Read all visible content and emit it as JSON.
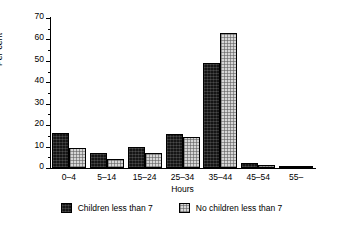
{
  "chart_data": {
    "type": "bar",
    "title": "",
    "xlabel": "Hours",
    "ylabel": "Per cent",
    "categories": [
      "0–4",
      "5–14",
      "15–24",
      "25–34",
      "35–44",
      "45–54",
      "55–"
    ],
    "series": [
      {
        "name": "Children less than 7",
        "color": "#151515",
        "values": [
          16.5,
          7,
          10,
          16,
          49,
          2.2,
          0.8
        ]
      },
      {
        "name": "No children less than 7",
        "color": "#d6d6d6",
        "values": [
          9.5,
          4,
          7,
          14.5,
          63,
          1.4,
          0.8
        ]
      }
    ],
    "ylim": [
      0,
      70
    ],
    "ytick_labels": [
      "0",
      "10",
      "20",
      "30",
      "40",
      "50",
      "60",
      "70"
    ],
    "ytick_values": [
      0,
      10,
      20,
      30,
      40,
      50,
      60,
      70
    ],
    "yminor_values": [
      5,
      15,
      25,
      35,
      45,
      55,
      65
    ],
    "grid": false,
    "legend_position": "bottom"
  },
  "legend": {
    "items": [
      {
        "label": "Children less than 7"
      },
      {
        "label": "No children less than 7"
      }
    ]
  }
}
